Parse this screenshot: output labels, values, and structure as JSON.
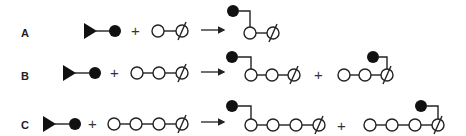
{
  "diagram": {
    "rows": [
      {
        "label": "A",
        "reactant_chain_length": 2,
        "products": [
          {
            "attach_index": 0,
            "chain_length": 2
          }
        ]
      },
      {
        "label": "B",
        "reactant_chain_length": 3,
        "products": [
          {
            "attach_index": 0,
            "chain_length": 3
          },
          {
            "attach_index": 2,
            "chain_length": 3
          }
        ]
      },
      {
        "label": "C",
        "reactant_chain_length": 4,
        "products": [
          {
            "attach_index": 0,
            "chain_length": 4
          },
          {
            "attach_index": 3,
            "chain_length": 4
          }
        ]
      }
    ],
    "plus": "+",
    "legend": {
      "triangle": "triangle-end-icon",
      "filled_circle": "filled-unit-icon",
      "open_circle": "open-unit-icon",
      "slashed_circle": "slashed-end-unit-icon"
    },
    "colors": {
      "ink": "#111111",
      "background": "#ffffff"
    }
  }
}
